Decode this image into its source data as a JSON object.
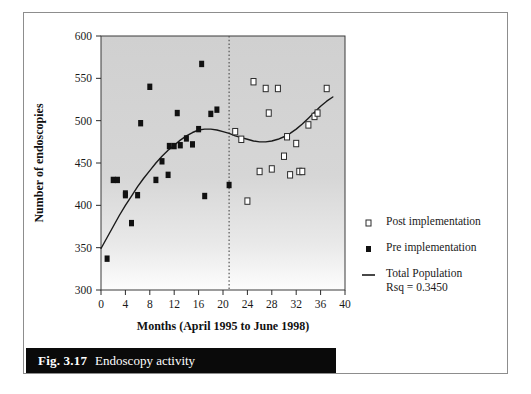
{
  "figure": {
    "caption_label": "Fig. 3.17",
    "caption_text": "Endoscopy activity"
  },
  "chart_data": {
    "type": "scatter",
    "title": "",
    "xlabel": "Months (April 1995 to June 1998)",
    "ylabel": "Number of endoscopies",
    "xlim": [
      0,
      40
    ],
    "ylim": [
      300,
      600
    ],
    "xticks": [
      0,
      4,
      8,
      12,
      16,
      20,
      24,
      28,
      32,
      36,
      40
    ],
    "yticks": [
      300,
      350,
      400,
      450,
      500,
      550,
      600
    ],
    "grid": false,
    "plot_background": "#d4d4d4",
    "marker_color": "#111111",
    "trend_color": "#1a1a1a",
    "divider": {
      "x": 21,
      "style": "dotted",
      "color": "#555555"
    },
    "series": [
      {
        "name": "Pre implementation",
        "marker": "filled-square",
        "points": [
          [
            1,
            337
          ],
          [
            2,
            430
          ],
          [
            2.7,
            430
          ],
          [
            4,
            412
          ],
          [
            4,
            414
          ],
          [
            5,
            379
          ],
          [
            6,
            412
          ],
          [
            6.5,
            497
          ],
          [
            8,
            540
          ],
          [
            9,
            430
          ],
          [
            10,
            452
          ],
          [
            11,
            436
          ],
          [
            11.2,
            470
          ],
          [
            12,
            470
          ],
          [
            12.5,
            509
          ],
          [
            13,
            471
          ],
          [
            14,
            479
          ],
          [
            15,
            472
          ],
          [
            16,
            490
          ],
          [
            16.5,
            567
          ],
          [
            17,
            411
          ],
          [
            18,
            508
          ],
          [
            19,
            513
          ],
          [
            21,
            424
          ]
        ]
      },
      {
        "name": "Post implementation",
        "marker": "open-square",
        "points": [
          [
            22,
            487
          ],
          [
            23,
            478
          ],
          [
            24,
            405
          ],
          [
            25,
            546
          ],
          [
            26,
            440
          ],
          [
            27,
            538
          ],
          [
            27.5,
            509
          ],
          [
            28,
            443
          ],
          [
            29,
            538
          ],
          [
            30,
            458
          ],
          [
            30.5,
            481
          ],
          [
            31,
            436
          ],
          [
            32,
            473
          ],
          [
            32.5,
            440
          ],
          [
            33,
            440
          ],
          [
            34,
            495
          ],
          [
            35,
            505
          ],
          [
            35.5,
            509
          ],
          [
            37,
            538
          ]
        ]
      }
    ],
    "trend": {
      "name": "Total Population",
      "rsq_label": "Rsq = 0.3450",
      "points": [
        [
          0,
          349
        ],
        [
          1,
          362
        ],
        [
          2,
          375
        ],
        [
          3,
          388
        ],
        [
          4,
          400
        ],
        [
          5,
          411
        ],
        [
          6,
          422
        ],
        [
          7,
          432
        ],
        [
          8,
          441
        ],
        [
          9,
          450
        ],
        [
          10,
          458
        ],
        [
          11,
          465
        ],
        [
          12,
          471
        ],
        [
          13,
          477
        ],
        [
          14,
          482
        ],
        [
          15,
          486
        ],
        [
          16,
          489
        ],
        [
          17,
          490
        ],
        [
          18,
          490
        ],
        [
          19,
          489
        ],
        [
          20,
          487
        ],
        [
          21,
          485
        ],
        [
          22,
          482
        ],
        [
          23,
          480
        ],
        [
          24,
          478
        ],
        [
          25,
          476
        ],
        [
          26,
          475
        ],
        [
          27,
          475
        ],
        [
          28,
          476
        ],
        [
          29,
          478
        ],
        [
          30,
          481
        ],
        [
          31,
          485
        ],
        [
          32,
          490
        ],
        [
          33,
          496
        ],
        [
          34,
          503
        ],
        [
          35,
          510
        ],
        [
          36,
          517
        ],
        [
          37,
          523
        ],
        [
          38,
          528
        ]
      ]
    },
    "legend": {
      "position": "right",
      "entries": [
        {
          "label": "Post implementation",
          "marker": "open-square"
        },
        {
          "label": "Pre implementation",
          "marker": "filled-square"
        },
        {
          "label": "Total Population",
          "marker": "line",
          "sublabel": "Rsq = 0.3450"
        }
      ]
    }
  }
}
